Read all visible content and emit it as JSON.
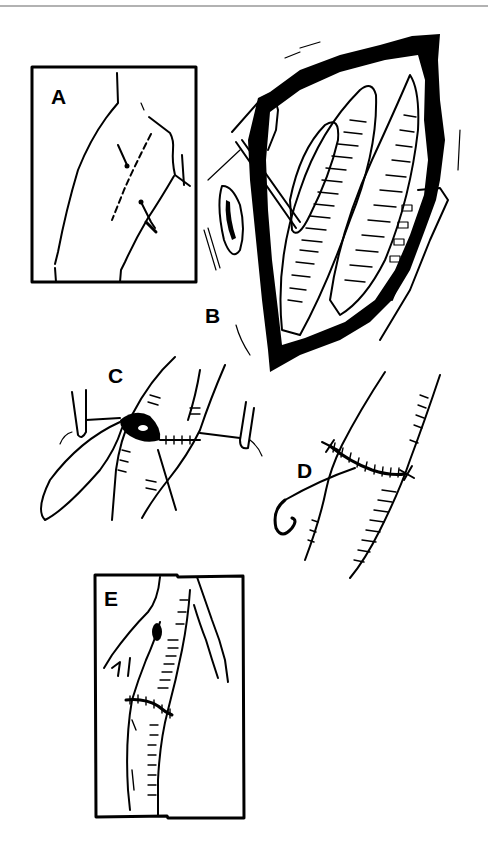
{
  "figure": {
    "type": "surgical-illustration",
    "style": "black-and-white line drawing",
    "colors": {
      "ink": "#000000",
      "paper": "#ffffff",
      "top_rule": "#999999"
    },
    "panels": [
      {
        "id": "A",
        "label": "A",
        "description": "boxed inset showing incision lines on the limb surface"
      },
      {
        "id": "B",
        "label": "B",
        "description": "open surgical field with retracted tissue and exposed vessel"
      },
      {
        "id": "C",
        "label": "C",
        "description": "vessel anastomosis with clamps and traction suture"
      },
      {
        "id": "D",
        "label": "D",
        "description": "completed circumferential suture line with curved needle"
      },
      {
        "id": "E",
        "label": "E",
        "description": "boxed view of repaired vessel with branching"
      }
    ]
  }
}
